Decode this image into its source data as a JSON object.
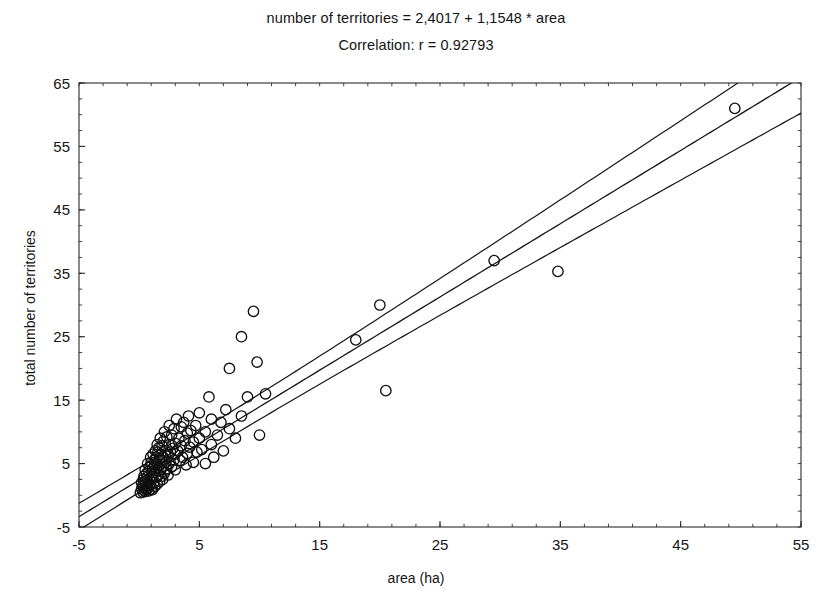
{
  "chart_data": {
    "type": "scatter",
    "title": "number of territories = 2,4017 + 1,1548 * area",
    "subtitle": "Correlation: r = 0.92793",
    "xlabel": "area (ha)",
    "ylabel": "total number of territories",
    "xlim": [
      -5,
      55
    ],
    "ylim": [
      -5,
      65
    ],
    "xticks": [
      -5,
      5,
      15,
      25,
      35,
      45,
      55
    ],
    "xtick_labels": [
      "-5",
      "5",
      "15",
      "25",
      "35",
      "45",
      "55"
    ],
    "yticks": [
      -5,
      5,
      15,
      25,
      35,
      45,
      55,
      65
    ],
    "ytick_labels": [
      "-5",
      "5",
      "15",
      "25",
      "35",
      "45",
      "55",
      "65"
    ],
    "x_minor_step": 2,
    "y_minor_step": 2.5,
    "grid": false,
    "legend": null,
    "marker_style": "open-circle",
    "marker_radius_px": 5.2,
    "regression": {
      "intercept": 2.4017,
      "slope": 1.1548,
      "r": 0.92793,
      "band_offset_lower": -1.9,
      "band_offset_upper": 1.9,
      "band_flare": 0.055
    },
    "points": [
      [
        0.1,
        0.4
      ],
      [
        0.2,
        1.0
      ],
      [
        0.2,
        2.0
      ],
      [
        0.3,
        0.5
      ],
      [
        0.3,
        1.5
      ],
      [
        0.35,
        2.5
      ],
      [
        0.4,
        0.8
      ],
      [
        0.4,
        3.0
      ],
      [
        0.45,
        1.2
      ],
      [
        0.5,
        0.6
      ],
      [
        0.5,
        2.2
      ],
      [
        0.5,
        4.0
      ],
      [
        0.55,
        1.8
      ],
      [
        0.6,
        0.9
      ],
      [
        0.6,
        3.4
      ],
      [
        0.65,
        2.8
      ],
      [
        0.7,
        1.1
      ],
      [
        0.7,
        5.0
      ],
      [
        0.75,
        2.0
      ],
      [
        0.8,
        0.7
      ],
      [
        0.8,
        3.8
      ],
      [
        0.85,
        1.6
      ],
      [
        0.9,
        4.5
      ],
      [
        0.9,
        2.4
      ],
      [
        0.95,
        6.0
      ],
      [
        1.0,
        1.0
      ],
      [
        1.0,
        3.0
      ],
      [
        1.0,
        5.2
      ],
      [
        1.05,
        2.6
      ],
      [
        1.1,
        4.2
      ],
      [
        1.1,
        0.9
      ],
      [
        1.15,
        6.5
      ],
      [
        1.2,
        2.0
      ],
      [
        1.2,
        3.6
      ],
      [
        1.25,
        5.5
      ],
      [
        1.3,
        1.4
      ],
      [
        1.3,
        4.8
      ],
      [
        1.35,
        7.0
      ],
      [
        1.4,
        2.8
      ],
      [
        1.4,
        6.0
      ],
      [
        1.45,
        3.9
      ],
      [
        1.5,
        1.8
      ],
      [
        1.5,
        5.0
      ],
      [
        1.5,
        8.0
      ],
      [
        1.55,
        6.8
      ],
      [
        1.6,
        3.2
      ],
      [
        1.6,
        4.4
      ],
      [
        1.65,
        7.5
      ],
      [
        1.7,
        2.2
      ],
      [
        1.7,
        5.8
      ],
      [
        1.75,
        9.0
      ],
      [
        1.8,
        4.0
      ],
      [
        1.8,
        6.4
      ],
      [
        1.85,
        3.0
      ],
      [
        1.9,
        7.8
      ],
      [
        1.9,
        5.4
      ],
      [
        1.95,
        2.5
      ],
      [
        2.0,
        4.6
      ],
      [
        2.0,
        6.0
      ],
      [
        2.0,
        8.5
      ],
      [
        2.1,
        3.5
      ],
      [
        2.1,
        10.0
      ],
      [
        2.2,
        5.2
      ],
      [
        2.2,
        7.0
      ],
      [
        2.3,
        4.2
      ],
      [
        2.3,
        9.2
      ],
      [
        2.4,
        6.2
      ],
      [
        2.4,
        3.2
      ],
      [
        2.5,
        8.0
      ],
      [
        2.5,
        5.0
      ],
      [
        2.5,
        11.0
      ],
      [
        2.6,
        6.8
      ],
      [
        2.7,
        4.5
      ],
      [
        2.7,
        9.5
      ],
      [
        2.8,
        7.4
      ],
      [
        2.9,
        5.6
      ],
      [
        2.9,
        10.5
      ],
      [
        3.0,
        8.2
      ],
      [
        3.0,
        4.0
      ],
      [
        3.0,
        6.5
      ],
      [
        3.1,
        12.0
      ],
      [
        3.2,
        7.0
      ],
      [
        3.3,
        9.0
      ],
      [
        3.4,
        5.5
      ],
      [
        3.5,
        10.8
      ],
      [
        3.5,
        7.8
      ],
      [
        3.6,
        6.0
      ],
      [
        3.7,
        11.5
      ],
      [
        3.8,
        8.6
      ],
      [
        3.9,
        4.8
      ],
      [
        4.0,
        9.8
      ],
      [
        4.0,
        6.6
      ],
      [
        4.1,
        12.5
      ],
      [
        4.2,
        7.6
      ],
      [
        4.3,
        10.2
      ],
      [
        4.5,
        8.4
      ],
      [
        4.5,
        5.2
      ],
      [
        4.7,
        11.0
      ],
      [
        4.8,
        6.8
      ],
      [
        5.0,
        9.0
      ],
      [
        5.0,
        13.0
      ],
      [
        5.2,
        7.2
      ],
      [
        5.5,
        10.0
      ],
      [
        5.5,
        5.0
      ],
      [
        5.8,
        15.5
      ],
      [
        6.0,
        8.0
      ],
      [
        6.0,
        12.0
      ],
      [
        6.2,
        6.0
      ],
      [
        6.5,
        9.5
      ],
      [
        6.8,
        11.5
      ],
      [
        7.0,
        7.0
      ],
      [
        7.2,
        13.5
      ],
      [
        7.5,
        20.0
      ],
      [
        7.5,
        10.5
      ],
      [
        8.0,
        9.0
      ],
      [
        8.5,
        12.5
      ],
      [
        8.5,
        25.0
      ],
      [
        9.0,
        15.5
      ],
      [
        9.5,
        29.0
      ],
      [
        9.8,
        21.0
      ],
      [
        10.0,
        9.5
      ],
      [
        10.5,
        16.0
      ],
      [
        18.0,
        24.5
      ],
      [
        20.0,
        30.0
      ],
      [
        20.5,
        16.5
      ],
      [
        29.5,
        37.0
      ],
      [
        34.8,
        35.3
      ],
      [
        49.5,
        61.0
      ]
    ]
  },
  "figure": {
    "background": "#ffffff",
    "foreground": "#141414",
    "plot_left_px": 79,
    "plot_top_px": 83,
    "plot_right_px": 801,
    "plot_bottom_px": 527
  }
}
